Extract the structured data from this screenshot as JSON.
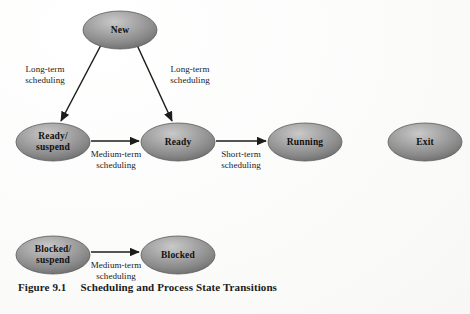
{
  "figure": {
    "caption_number": "Figure 9.1",
    "caption_title": "Scheduling and Process State Transitions"
  },
  "colors": {
    "node_fill_light": "#b9b9b9",
    "node_fill_mid": "#8f8f8f",
    "node_fill_dark": "#6e6e6e",
    "node_stroke": "#5a5a5a",
    "edge_stroke": "#1c1c1c",
    "text": "#111111",
    "background": "#fdfdfd"
  },
  "nodes": [
    {
      "id": "new",
      "label": "New",
      "label_lines": [
        "New"
      ],
      "cx": 120,
      "cy": 30,
      "rx": 37,
      "ry": 19
    },
    {
      "id": "ready_suspend",
      "label": "Ready/suspend",
      "label_lines": [
        "Ready/",
        "suspend"
      ],
      "cx": 53,
      "cy": 142,
      "rx": 37,
      "ry": 19
    },
    {
      "id": "ready",
      "label": "Ready",
      "label_lines": [
        "Ready"
      ],
      "cx": 178,
      "cy": 142,
      "rx": 37,
      "ry": 19
    },
    {
      "id": "running",
      "label": "Running",
      "label_lines": [
        "Running"
      ],
      "cx": 305,
      "cy": 142,
      "rx": 37,
      "ry": 19
    },
    {
      "id": "exit",
      "label": "Exit",
      "label_lines": [
        "Exit"
      ],
      "cx": 425,
      "cy": 142,
      "rx": 37,
      "ry": 19
    },
    {
      "id": "blocked_suspend",
      "label": "Blocked/suspend",
      "label_lines": [
        "Blocked/",
        "suspend"
      ],
      "cx": 53,
      "cy": 255,
      "rx": 37,
      "ry": 19
    },
    {
      "id": "blocked",
      "label": "Blocked",
      "label_lines": [
        "Blocked"
      ],
      "cx": 178,
      "cy": 255,
      "rx": 37,
      "ry": 19
    }
  ],
  "edges": [
    {
      "id": "new-to-ready-suspend",
      "from": "new",
      "to": "ready_suspend",
      "label_lines": [
        "Long-term",
        "scheduling"
      ],
      "label_x": 45,
      "label_y": 72,
      "x1": 101,
      "y1": 45,
      "x2": 61,
      "y2": 121
    },
    {
      "id": "new-to-ready",
      "from": "new",
      "to": "ready",
      "label_lines": [
        "Long-term",
        "scheduling"
      ],
      "label_x": 190,
      "label_y": 72,
      "x1": 137,
      "y1": 45,
      "x2": 172,
      "y2": 121
    },
    {
      "id": "ready-suspend-to-ready",
      "from": "ready_suspend",
      "to": "ready",
      "label_lines": [
        "Medium-term",
        "scheduling"
      ],
      "label_x": 116,
      "label_y": 157,
      "x1": 91,
      "y1": 141,
      "x2": 139,
      "y2": 141
    },
    {
      "id": "ready-to-running",
      "from": "ready",
      "to": "running",
      "label_lines": [
        "Short-term",
        "scheduling"
      ],
      "label_x": 241,
      "label_y": 157,
      "x1": 216,
      "y1": 141,
      "x2": 266,
      "y2": 141
    },
    {
      "id": "blocked-suspend-to-blocked",
      "from": "blocked_suspend",
      "to": "blocked",
      "label_lines": [
        "Medium-term",
        "scheduling"
      ],
      "label_x": 116,
      "label_y": 268,
      "x1": 91,
      "y1": 252,
      "x2": 139,
      "y2": 252
    }
  ]
}
